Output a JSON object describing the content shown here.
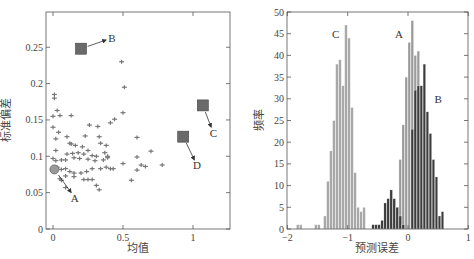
{
  "chart_data": [
    {
      "type": "scatter",
      "title": "",
      "xlabel": "均值",
      "ylabel": "标准偏差",
      "xlim": [
        -0.03,
        1.3
      ],
      "ylim": [
        0,
        0.3
      ],
      "xticks": [
        0,
        0.5,
        1
      ],
      "xtick_labels": [
        "0",
        "0.5",
        "1"
      ],
      "yticks": [
        0,
        0.05,
        0.1,
        0.15,
        0.2,
        0.25
      ],
      "ytick_labels": [
        "0",
        "0.05",
        "0.1",
        "0.15",
        "0.2",
        "0.25"
      ],
      "grid": false,
      "points": [
        [
          0.01,
          0.185
        ],
        [
          0.01,
          0.18
        ],
        [
          0.03,
          0.163
        ],
        [
          0.0,
          0.155
        ],
        [
          0.05,
          0.156
        ],
        [
          0.13,
          0.156
        ],
        [
          0.49,
          0.23
        ],
        [
          0.51,
          0.195
        ],
        [
          0.5,
          0.16
        ],
        [
          0.26,
          0.143
        ],
        [
          0.32,
          0.141
        ],
        [
          0.41,
          0.146
        ],
        [
          0.44,
          0.151
        ],
        [
          0.0,
          0.14
        ],
        [
          0.04,
          0.133
        ],
        [
          0.02,
          0.124
        ],
        [
          0.1,
          0.127
        ],
        [
          0.23,
          0.128
        ],
        [
          0.33,
          0.127
        ],
        [
          0.34,
          0.118
        ],
        [
          0.38,
          0.115
        ],
        [
          0.6,
          0.126
        ],
        [
          0.02,
          0.108
        ],
        [
          0.12,
          0.118
        ],
        [
          0.13,
          0.117
        ],
        [
          0.16,
          0.115
        ],
        [
          0.21,
          0.113
        ],
        [
          0.1,
          0.103
        ],
        [
          0.14,
          0.104
        ],
        [
          0.18,
          0.105
        ],
        [
          0.22,
          0.103
        ],
        [
          0.25,
          0.108
        ],
        [
          0.28,
          0.101
        ],
        [
          0.31,
          0.1
        ],
        [
          0.37,
          0.105
        ],
        [
          0.39,
          0.1
        ],
        [
          0.0,
          0.097
        ],
        [
          0.02,
          0.094
        ],
        [
          0.06,
          0.095
        ],
        [
          0.09,
          0.095
        ],
        [
          0.15,
          0.098
        ],
        [
          0.19,
          0.097
        ],
        [
          0.25,
          0.096
        ],
        [
          0.3,
          0.094
        ],
        [
          0.36,
          0.095
        ],
        [
          0.39,
          0.098
        ],
        [
          0.5,
          0.09
        ],
        [
          0.6,
          0.099
        ],
        [
          0.63,
          0.088
        ],
        [
          0.66,
          0.086
        ],
        [
          0.7,
          0.107
        ],
        [
          0.78,
          0.088
        ],
        [
          0.03,
          0.085
        ],
        [
          0.06,
          0.082
        ],
        [
          0.09,
          0.083
        ],
        [
          0.12,
          0.079
        ],
        [
          0.15,
          0.077
        ],
        [
          0.2,
          0.077
        ],
        [
          0.24,
          0.079
        ],
        [
          0.28,
          0.083
        ],
        [
          0.34,
          0.083
        ],
        [
          0.38,
          0.085
        ],
        [
          0.41,
          0.083
        ],
        [
          0.43,
          0.083
        ],
        [
          0.6,
          0.081
        ],
        [
          0.05,
          0.069
        ],
        [
          0.09,
          0.073
        ],
        [
          0.15,
          0.072
        ],
        [
          0.22,
          0.068
        ],
        [
          0.25,
          0.068
        ],
        [
          0.28,
          0.068
        ],
        [
          0.06,
          0.067
        ],
        [
          0.31,
          0.06
        ],
        [
          0.33,
          0.054
        ],
        [
          0.09,
          0.057
        ],
        [
          0.56,
          0.067
        ]
      ],
      "highlighted": [
        {
          "label": "A",
          "x": 0.01,
          "y": 0.082,
          "shape": "circle",
          "arrow_to": [
            0.13,
            0.05
          ]
        },
        {
          "label": "B",
          "x": 0.2,
          "y": 0.248,
          "shape": "square",
          "arrow_to": [
            0.38,
            0.26
          ]
        },
        {
          "label": "C",
          "x": 1.07,
          "y": 0.17,
          "shape": "square",
          "arrow_to": [
            1.13,
            0.14
          ]
        },
        {
          "label": "D",
          "x": 0.93,
          "y": 0.127,
          "shape": "square",
          "arrow_to": [
            1.01,
            0.095
          ]
        }
      ]
    },
    {
      "type": "bar",
      "subtype": "histogram",
      "title": "",
      "xlabel": "预测误差",
      "ylabel": "频率",
      "xlim": [
        -2,
        1
      ],
      "ylim": [
        0,
        50
      ],
      "xticks": [
        -2,
        -1,
        0,
        1
      ],
      "xtick_labels": [
        "−2",
        "−1",
        "0",
        "1"
      ],
      "yticks": [
        0,
        5,
        10,
        15,
        20,
        25,
        30,
        35,
        40,
        45,
        50
      ],
      "ytick_labels": [
        "0",
        "5",
        "10",
        "15",
        "20",
        "25",
        "30",
        "35",
        "40",
        "45",
        "50"
      ],
      "grid": false,
      "bin_width": 0.0333,
      "series": [
        {
          "name": "C",
          "color": "#a8a8a8",
          "bin_starts": [
            -1.85,
            -1.8,
            -1.55,
            -1.5,
            -1.4,
            -1.35,
            -1.3,
            -1.25,
            -1.2,
            -1.15,
            -1.1,
            -1.05,
            -1.0,
            -0.95,
            -0.9,
            -0.85,
            -0.8,
            -0.75,
            -0.7
          ],
          "values": [
            1,
            1,
            1,
            1,
            3,
            11,
            18,
            25,
            38,
            39,
            33,
            47,
            44,
            28,
            13,
            5,
            4,
            5,
            0
          ]
        },
        {
          "name": "A",
          "color": "#9a9a9a",
          "bin_starts": [
            -0.3,
            -0.25,
            -0.2,
            -0.15,
            -0.1,
            -0.05,
            0.0,
            0.05,
            0.1,
            0.15,
            0.2
          ],
          "values": [
            1,
            2,
            3,
            16,
            24,
            35,
            43,
            48,
            40,
            41,
            1
          ]
        },
        {
          "name": "B",
          "color": "#3c3c3c",
          "bin_starts": [
            -0.6,
            -0.55,
            -0.5,
            -0.45,
            -0.4,
            -0.35,
            -0.3,
            -0.25,
            -0.2,
            -0.15,
            -0.1,
            0.05,
            0.1,
            0.15,
            0.2,
            0.25,
            0.3,
            0.35,
            0.4,
            0.45,
            0.5,
            0.55,
            0.6,
            0.65
          ],
          "values": [
            1,
            1,
            1,
            2,
            6,
            7,
            9,
            7,
            5,
            3,
            1,
            23,
            32,
            33,
            33,
            38,
            27,
            22,
            16,
            12,
            3,
            4,
            0,
            0
          ]
        }
      ],
      "annotations": [
        {
          "text": "C",
          "x": -1.2,
          "y": 45
        },
        {
          "text": "A",
          "x": -0.15,
          "y": 45
        },
        {
          "text": "B",
          "x": 0.5,
          "y": 30
        }
      ]
    }
  ]
}
